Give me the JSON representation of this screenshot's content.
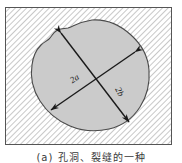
{
  "figure": {
    "caption": "(a) 孔洞、裂缝的一种",
    "frame": {
      "x": 5,
      "y": 7,
      "width": 167,
      "height": 138,
      "border_color": "#555555",
      "background_color": "#ffffff",
      "hatch": {
        "name": "diagonal-hatch",
        "angle_deg": 45,
        "direction": "down-right",
        "spacing_px": 4,
        "line_color": "#9a9a9a",
        "line_width": 1
      }
    },
    "blob": {
      "name": "irregular-inclusion-shape",
      "fill_color": "#cbcbcb",
      "stroke_color": "#4a4a4a",
      "stroke_width": 1
    },
    "axes": [
      {
        "id": "major-axis",
        "label": "2a",
        "label_x": 76,
        "label_y": 81,
        "label_rotation_deg": -33,
        "x1": 61,
        "y1": 33,
        "x2": 129,
        "y2": 122,
        "double_headed": true,
        "color": "#1a1a1a"
      },
      {
        "id": "minor-axis",
        "label": "2b",
        "label_x": 116,
        "label_y": 92,
        "label_rotation_deg": 63,
        "x1": 135,
        "y1": 52,
        "x2": 51,
        "y2": 110,
        "double_headed": true,
        "color": "#1a1a1a"
      }
    ],
    "label_color": "#1a1a1a",
    "label_font_size": 9
  }
}
